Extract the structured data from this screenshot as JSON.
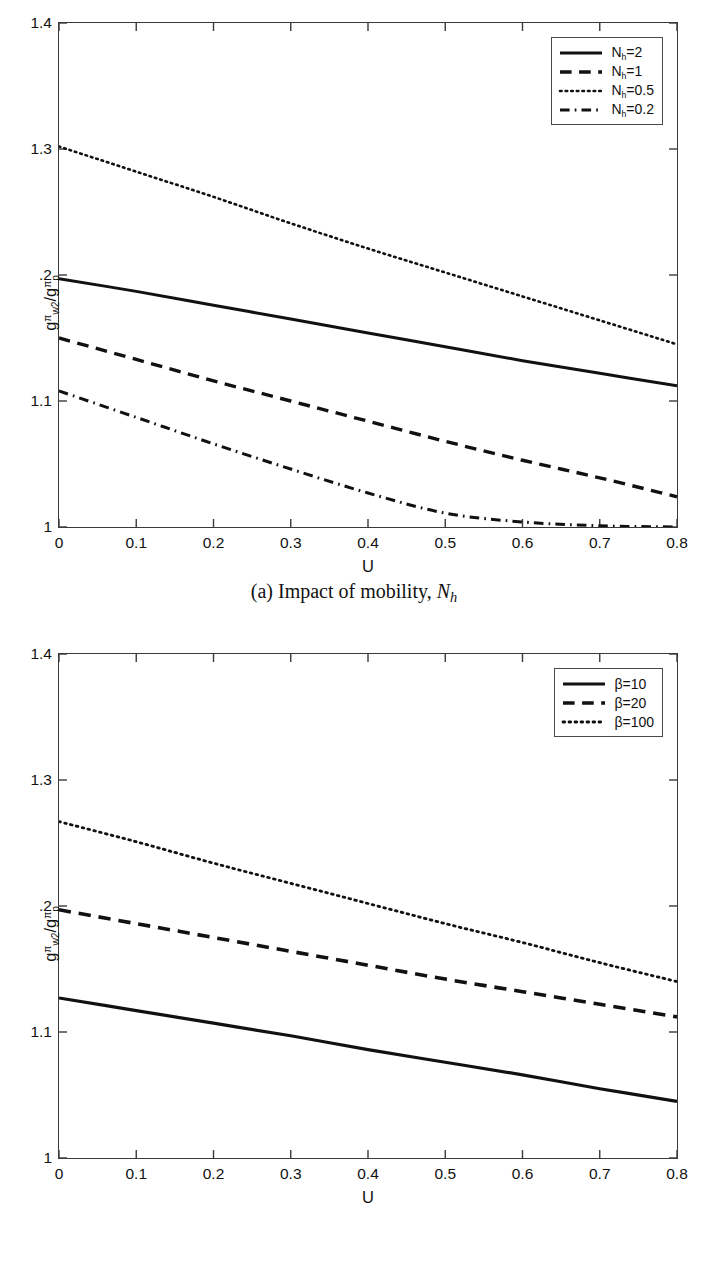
{
  "figure": {
    "panels": [
      {
        "id": "a",
        "caption_prefix": "(a) Impact of mobility, ",
        "caption_symbol": "N",
        "caption_symbol_sub": "h"
      },
      {
        "id": "b",
        "caption_prefix": "(b) Impact of weighting factor, ",
        "caption_symbol": "β",
        "caption_symbol_sub": ""
      }
    ]
  },
  "axis_label": {
    "x": "U",
    "y_numerator_base": "g",
    "y_numerator_sup": "π",
    "y_numerator_sub": "w2",
    "y_slash": "/",
    "y_denominator_base": "g",
    "y_denominator_sup": "π",
    "y_denominator_sub": "p"
  },
  "chart_data": [
    {
      "type": "line",
      "title": "(a) Impact of mobility, N_h",
      "xlabel": "U",
      "ylabel": "g^π_w2 / g^π_p",
      "xlim": [
        0,
        0.8
      ],
      "ylim": [
        1,
        1.4
      ],
      "xticks": [
        0,
        0.1,
        0.2,
        0.3,
        0.4,
        0.5,
        0.6,
        0.7,
        0.8
      ],
      "xticklabels": [
        "0",
        "0.1",
        "0.2",
        "0.3",
        "0.4",
        "0.5",
        "0.6",
        "0.7",
        "0.8"
      ],
      "yticks": [
        1,
        1.1,
        1.2,
        1.3,
        1.4
      ],
      "yticklabels": [
        "1",
        "1.1",
        ".2",
        "1.3",
        "1.4"
      ],
      "grid": false,
      "legend_position": "upper right",
      "x": [
        0.0,
        0.1,
        0.2,
        0.3,
        0.4,
        0.5,
        0.6,
        0.7,
        0.8
      ],
      "series": [
        {
          "name": "N_h=2",
          "label": "N",
          "label_sub": "h",
          "label_rest": "=2",
          "style": "solid",
          "color": "#111111",
          "width": 3.0,
          "values": [
            1.197,
            1.187,
            1.176,
            1.165,
            1.154,
            1.143,
            1.132,
            1.122,
            1.112
          ]
        },
        {
          "name": "N_h=1",
          "label": "N",
          "label_sub": "h",
          "label_rest": "=1",
          "style": "dashed",
          "color": "#111111",
          "width": 3.4,
          "values": [
            1.15,
            1.133,
            1.116,
            1.1,
            1.084,
            1.068,
            1.053,
            1.039,
            1.024
          ]
        },
        {
          "name": "N_h=0.5",
          "label": "N",
          "label_sub": "h",
          "label_rest": "=0.5",
          "style": "dotted",
          "color": "#111111",
          "width": 2.6,
          "values": [
            1.302,
            1.282,
            1.262,
            1.241,
            1.221,
            1.202,
            1.183,
            1.164,
            1.145
          ]
        },
        {
          "name": "N_h=0.2",
          "label": "N",
          "label_sub": "h",
          "label_rest": "=0.2",
          "style": "dashdot",
          "color": "#111111",
          "width": 3.0,
          "values": [
            1.108,
            1.087,
            1.066,
            1.046,
            1.027,
            1.011,
            1.004,
            1.001,
            1.0
          ]
        }
      ]
    },
    {
      "type": "line",
      "title": "(b) Impact of weighting factor, β",
      "xlabel": "U",
      "ylabel": "g^π_w2 / g^π_p",
      "xlim": [
        0,
        0.8
      ],
      "ylim": [
        1,
        1.4
      ],
      "xticks": [
        0,
        0.1,
        0.2,
        0.3,
        0.4,
        0.5,
        0.6,
        0.7,
        0.8
      ],
      "xticklabels": [
        "0",
        "0.1",
        "0.2",
        "0.3",
        "0.4",
        "0.5",
        "0.6",
        "0.7",
        "0.8"
      ],
      "yticks": [
        1,
        1.1,
        1.2,
        1.3,
        1.4
      ],
      "yticklabels": [
        "1",
        "1.1",
        ".2",
        "1.3",
        "1.4"
      ],
      "grid": false,
      "legend_position": "upper right",
      "x": [
        0.0,
        0.1,
        0.2,
        0.3,
        0.4,
        0.5,
        0.6,
        0.7,
        0.8
      ],
      "series": [
        {
          "name": "β=10",
          "label": "β",
          "label_sub": "",
          "label_rest": "=10",
          "style": "solid",
          "color": "#111111",
          "width": 3.2,
          "values": [
            1.127,
            1.117,
            1.107,
            1.097,
            1.086,
            1.076,
            1.066,
            1.055,
            1.045
          ]
        },
        {
          "name": "β=20",
          "label": "β",
          "label_sub": "",
          "label_rest": "=20",
          "style": "dashed",
          "color": "#111111",
          "width": 3.6,
          "values": [
            1.197,
            1.186,
            1.175,
            1.164,
            1.153,
            1.142,
            1.132,
            1.122,
            1.112
          ]
        },
        {
          "name": "β=100",
          "label": "β",
          "label_sub": "",
          "label_rest": "=100",
          "style": "dotted",
          "color": "#111111",
          "width": 2.8,
          "values": [
            1.267,
            1.251,
            1.234,
            1.218,
            1.202,
            1.186,
            1.171,
            1.155,
            1.14
          ]
        }
      ]
    }
  ]
}
